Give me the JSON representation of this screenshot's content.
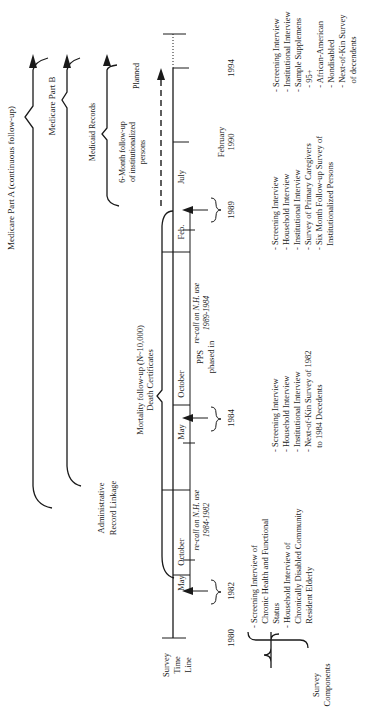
{
  "diagram": {
    "orientation": "rotated-90-ccw",
    "timeline": {
      "label_lines": [
        "Survey",
        "Time",
        "Line"
      ],
      "years": [
        "1980",
        "1982",
        "1984",
        "1989",
        "1994"
      ],
      "extra_date_lines": [
        "February",
        "1990"
      ],
      "months": {
        "may_1982": "May",
        "october_1982": "October",
        "may_1984": "May",
        "october_1984": "October",
        "feb_1989": "Feb.",
        "july_1989": "July"
      },
      "recall_1984": [
        "re-call on N.H. use",
        "1984-1982"
      ],
      "recall_1989": [
        "re-call on N.H. use",
        "1989-1984"
      ],
      "pps": [
        "PPS",
        "phased in"
      ],
      "planned": "Planned",
      "six_month": [
        "6-Month follow-up",
        "of institutionalized",
        "persons"
      ]
    },
    "admin": {
      "label_lines": [
        "Administrative",
        "Record Linkage"
      ],
      "medicare_a": "Medicare Part A (continuous follow-up)",
      "medicare_b": "Medicare Part B",
      "medicaid": "Medicaid Records",
      "mortality_lines": [
        "Mortality follow-up (N~10,000)",
        "Death Certificates"
      ]
    },
    "survey_components": {
      "label_lines": [
        "Survey",
        "Components"
      ],
      "c1982": [
        "- Screening Interview of",
        "  Chronic Health and Functional",
        "  Status",
        "- Household Interview of",
        "  Chronically Disabled Community",
        "  Resident Elderly"
      ],
      "c1984": [
        "- Screening Interview",
        "- Household Interview",
        "- Institutional Interview",
        "- Next-of-Kin Survey of 1982",
        "  to 1984 Decedents"
      ],
      "c1989": [
        "- Screening Interview",
        "- Household Interview",
        "- Institutional Interview",
        "- Survey of Primary Caregivers",
        "- Six Month Follow-up Survey of",
        "  Institutionalized Persons"
      ],
      "c1994": [
        "- Screening Interview",
        "- Institutional Interview",
        "- Sample Supplemens",
        "  - 95+",
        "  - African-American",
        "  - Nondisabled",
        "  - Next-of-Kin Survey",
        "    of decendents"
      ]
    }
  }
}
